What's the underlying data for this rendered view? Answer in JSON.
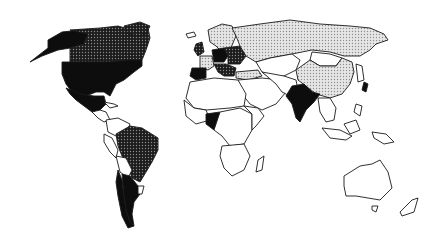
{
  "map": {
    "title": "",
    "projection": "world",
    "legend": [],
    "categories": {
      "black": {
        "fill": "#0d0d0d"
      },
      "dark_stipple": {
        "fill": "#3a3a3a",
        "pattern": "dark-dots"
      },
      "light_stipple": {
        "fill": "#cfcfcf",
        "pattern": "light-dots"
      },
      "white": {
        "fill": "#ffffff"
      }
    },
    "regions": [
      {
        "name": "alaska",
        "category": "black",
        "points": "48,40 62,32 80,30 88,34 84,44 70,48 58,50 42,56 30,62 48,48"
      },
      {
        "name": "canada",
        "category": "dark_stipple",
        "points": "70,30 100,28 118,26 132,30 148,28 150,38 146,50 142,60 128,60 110,62 70,62 70,48 84,44 88,34"
      },
      {
        "name": "greenland",
        "category": "dark_stipple",
        "points": "124,26 140,22 150,26 146,34 138,36 128,34"
      },
      {
        "name": "usa",
        "category": "black",
        "points": "62,62 110,62 128,60 142,60 142,66 134,72 124,80 116,84 110,96 104,92 96,92 86,96 72,92 66,84 62,74"
      },
      {
        "name": "mexico",
        "category": "black",
        "points": "66,88 80,94 94,96 104,96 106,104 100,110 92,112 84,106 76,100 70,94"
      },
      {
        "name": "central-america",
        "category": "white",
        "points": "92,112 100,110 106,112 110,120 104,122 98,118"
      },
      {
        "name": "caribbean",
        "category": "white",
        "points": "104,102 114,104 118,106 110,108"
      },
      {
        "name": "colombia-venezuela",
        "category": "white",
        "points": "106,120 118,118 130,124 126,134 116,136 108,132"
      },
      {
        "name": "peru-ecuador",
        "category": "white",
        "points": "104,134 112,138 118,150 116,158 110,152 104,142"
      },
      {
        "name": "brazil",
        "category": "dark_stipple",
        "points": "116,134 130,126 142,128 158,138 158,150 152,162 146,172 140,182 132,178 128,166 122,156 118,146"
      },
      {
        "name": "bolivia-paraguay",
        "category": "white",
        "points": "116,156 126,158 132,170 128,178 120,172"
      },
      {
        "name": "chile",
        "category": "black",
        "points": "118,170 122,180 124,196 126,210 130,222 134,226 128,228 122,216 118,196 116,182"
      },
      {
        "name": "argentina",
        "category": "black",
        "points": "122,174 130,176 138,186 140,194 134,202 132,214 134,226 130,222 126,210 124,196"
      },
      {
        "name": "uruguay",
        "category": "white",
        "points": "138,186 144,186 142,194 138,194"
      },
      {
        "name": "iceland",
        "category": "white",
        "points": "186,34 194,32 196,36 188,38"
      },
      {
        "name": "scandinavia",
        "category": "light_stipple",
        "points": "208,30 222,24 232,26 236,36 230,50 222,52 216,46 210,42"
      },
      {
        "name": "uk-ireland",
        "category": "dark_stipple",
        "points": "196,44 202,42 204,52 198,56 194,50"
      },
      {
        "name": "france",
        "category": "light_stipple",
        "points": "200,56 212,56 214,66 208,70 200,68"
      },
      {
        "name": "iberia",
        "category": "black",
        "points": "192,68 206,68 206,78 196,80 190,76"
      },
      {
        "name": "germany-central",
        "category": "black",
        "points": "212,50 224,48 228,56 224,62 214,62"
      },
      {
        "name": "eastern-europe",
        "category": "dark_stipple",
        "points": "224,48 240,46 246,56 240,64 228,64 228,56"
      },
      {
        "name": "italy-balkans",
        "category": "dark_stipple",
        "points": "214,64 226,64 236,68 234,76 224,76 218,72"
      },
      {
        "name": "turkey",
        "category": "light_stipple",
        "points": "236,72 258,70 262,76 248,80 236,78"
      },
      {
        "name": "russia",
        "category": "light_stipple",
        "points": "232,28 260,24 290,20 320,24 350,26 370,28 384,34 388,40 376,44 370,50 360,56 344,56 330,52 312,50 292,54 270,58 256,62 246,56 240,46 236,36"
      },
      {
        "name": "kazakhstan-central-asia",
        "category": "white",
        "points": "256,62 270,58 292,54 300,60 296,70 284,76 270,78 262,72"
      },
      {
        "name": "mongolia",
        "category": "white",
        "points": "312,52 330,54 342,58 336,66 320,66 310,60"
      },
      {
        "name": "china",
        "category": "light_stipple",
        "points": "296,70 310,60 320,66 336,66 342,58 352,62 354,72 350,84 342,94 330,98 316,94 306,86 298,80"
      },
      {
        "name": "korea-japan",
        "category": "white",
        "points": "356,64 362,66 364,80 358,82"
      },
      {
        "name": "japan-islands",
        "category": "black",
        "points": "364,82 368,84 366,92 362,90"
      },
      {
        "name": "middle-east",
        "category": "white",
        "points": "238,80 262,78 280,80 286,92 276,104 262,110 250,104 242,94"
      },
      {
        "name": "iran-afghanistan-pakistan",
        "category": "white",
        "points": "262,72 284,76 296,80 298,90 290,96 282,92 276,84"
      },
      {
        "name": "india",
        "category": "black",
        "points": "292,86 304,84 312,92 320,94 314,102 306,110 300,122 296,118 292,104 286,96"
      },
      {
        "name": "southeast-asia",
        "category": "white",
        "points": "318,98 330,98 336,108 334,120 326,122 320,112"
      },
      {
        "name": "indonesia",
        "category": "white",
        "points": "322,128 340,130 352,136 346,140 330,138"
      },
      {
        "name": "borneo-sulawesi",
        "category": "white",
        "points": "344,124 356,120 360,130 350,134"
      },
      {
        "name": "new-guinea",
        "category": "white",
        "points": "372,132 386,134 394,142 384,144 374,138"
      },
      {
        "name": "philippines",
        "category": "white",
        "points": "356,104 362,106 360,116 354,112"
      },
      {
        "name": "north-africa",
        "category": "white",
        "points": "190,82 214,78 238,80 246,94 244,106 230,108 206,110 194,108 186,98"
      },
      {
        "name": "west-africa",
        "category": "white",
        "points": "184,100 194,108 206,110 210,120 196,124 186,116"
      },
      {
        "name": "nigeria",
        "category": "black",
        "points": "206,114 220,112 224,124 214,130 206,124"
      },
      {
        "name": "central-africa",
        "category": "white",
        "points": "220,112 240,108 252,114 252,130 244,144 230,146 222,136 214,130"
      },
      {
        "name": "east-africa",
        "category": "white",
        "points": "244,106 258,108 264,116 256,126 252,130 252,114"
      },
      {
        "name": "southern-africa",
        "category": "white",
        "points": "222,146 244,144 250,156 244,170 232,176 224,168 220,156"
      },
      {
        "name": "madagascar",
        "category": "white",
        "points": "258,160 264,156 262,170 256,172"
      },
      {
        "name": "australia",
        "category": "white",
        "points": "344,176 360,166 372,164 380,160 388,172 392,188 380,200 368,198 356,196 346,196 344,186"
      },
      {
        "name": "tasmania",
        "category": "white",
        "points": "372,206 378,206 376,212 372,210"
      },
      {
        "name": "new-zealand",
        "category": "white",
        "points": "412,200 418,198 414,212 402,216 400,212"
      }
    ]
  }
}
